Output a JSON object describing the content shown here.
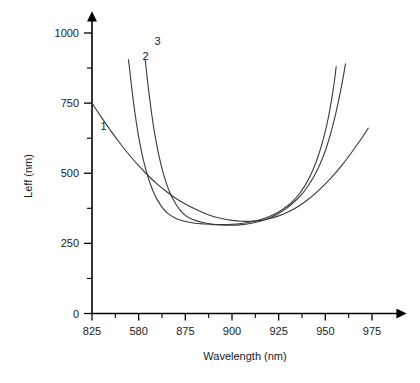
{
  "chart_data": {
    "type": "line",
    "title": "",
    "xlabel": "Wavelength (nm)",
    "ylabel": "Leff (nm)",
    "xlim": [
      825,
      987
    ],
    "ylim": [
      0,
      1060
    ],
    "grid": false,
    "legend_position": "inline-labels",
    "x_ticks_major": [
      {
        "value": 825,
        "label": "825"
      },
      {
        "value": 850,
        "label": "580"
      },
      {
        "value": 875,
        "label": "875"
      },
      {
        "value": 900,
        "label": "900"
      },
      {
        "value": 925,
        "label": "925"
      },
      {
        "value": 950,
        "label": "950"
      },
      {
        "value": 975,
        "label": "975"
      }
    ],
    "x_ticks_minor": [
      837.5,
      862.5,
      887.5,
      912.5,
      937.5,
      962.5
    ],
    "y_ticks_major": [
      {
        "value": 0,
        "label": "0"
      },
      {
        "value": 250,
        "label": "250"
      },
      {
        "value": 500,
        "label": "500"
      },
      {
        "value": 750,
        "label": "750"
      },
      {
        "value": 1000,
        "label": "1000"
      }
    ],
    "y_ticks_minor": [
      125,
      375,
      625,
      875
    ],
    "series": [
      {
        "name": "1",
        "label": "1",
        "label_x": 829.5,
        "label_y": 655,
        "points": [
          [
            825,
            750
          ],
          [
            830,
            700
          ],
          [
            835,
            652
          ],
          [
            840,
            607
          ],
          [
            845,
            565
          ],
          [
            850,
            527
          ],
          [
            855,
            492
          ],
          [
            860,
            461
          ],
          [
            865,
            434
          ],
          [
            870,
            410
          ],
          [
            875,
            390
          ],
          [
            880,
            373
          ],
          [
            885,
            358
          ],
          [
            890,
            346
          ],
          [
            895,
            338
          ],
          [
            900,
            332
          ],
          [
            905,
            329
          ],
          [
            910,
            329
          ],
          [
            915,
            332
          ],
          [
            920,
            338
          ],
          [
            925,
            348
          ],
          [
            930,
            362
          ],
          [
            935,
            380
          ],
          [
            940,
            403
          ],
          [
            945,
            430
          ],
          [
            950,
            462
          ],
          [
            955,
            498
          ],
          [
            960,
            538
          ],
          [
            965,
            583
          ],
          [
            970,
            630
          ],
          [
            973,
            661
          ]
        ]
      },
      {
        "name": "2",
        "label": "2",
        "label_x": 852,
        "label_y": 905,
        "points": [
          [
            844.5,
            905
          ],
          [
            845,
            880
          ],
          [
            846,
            820
          ],
          [
            847,
            765
          ],
          [
            848,
            715
          ],
          [
            849,
            670
          ],
          [
            850,
            630
          ],
          [
            852,
            563
          ],
          [
            854,
            509
          ],
          [
            856,
            466
          ],
          [
            858,
            432
          ],
          [
            860,
            405
          ],
          [
            863,
            375
          ],
          [
            866,
            355
          ],
          [
            870,
            339
          ],
          [
            875,
            328
          ],
          [
            880,
            322
          ],
          [
            885,
            319
          ],
          [
            890,
            317
          ],
          [
            895,
            317
          ],
          [
            900,
            318
          ],
          [
            905,
            321
          ],
          [
            910,
            326
          ],
          [
            915,
            334
          ],
          [
            920,
            346
          ],
          [
            925,
            362
          ],
          [
            930,
            385
          ],
          [
            933,
            403
          ],
          [
            936,
            426
          ],
          [
            939,
            455
          ],
          [
            942,
            492
          ],
          [
            944,
            522
          ],
          [
            946,
            558
          ],
          [
            948,
            600
          ],
          [
            950,
            650
          ],
          [
            951.5,
            695
          ],
          [
            953,
            748
          ],
          [
            954,
            790
          ],
          [
            955,
            835
          ],
          [
            955.8,
            880
          ]
        ]
      },
      {
        "name": "3",
        "label": "3",
        "label_x": 858.5,
        "label_y": 957,
        "points": [
          [
            853.5,
            905
          ],
          [
            854,
            875
          ],
          [
            855,
            815
          ],
          [
            856,
            760
          ],
          [
            857,
            710
          ],
          [
            858,
            665
          ],
          [
            859,
            625
          ],
          [
            861,
            558
          ],
          [
            863,
            504
          ],
          [
            865,
            461
          ],
          [
            867,
            427
          ],
          [
            869,
            400
          ],
          [
            872,
            370
          ],
          [
            875,
            350
          ],
          [
            879,
            335
          ],
          [
            884,
            325
          ],
          [
            889,
            319
          ],
          [
            894,
            316
          ],
          [
            899,
            315
          ],
          [
            904,
            316
          ],
          [
            909,
            320
          ],
          [
            914,
            327
          ],
          [
            919,
            338
          ],
          [
            924,
            353
          ],
          [
            929,
            374
          ],
          [
            934,
            402
          ],
          [
            938,
            430
          ],
          [
            941,
            457
          ],
          [
            944,
            490
          ],
          [
            947,
            530
          ],
          [
            950,
            580
          ],
          [
            952,
            622
          ],
          [
            954,
            670
          ],
          [
            956,
            725
          ],
          [
            958,
            788
          ],
          [
            959.5,
            840
          ],
          [
            960.8,
            890
          ]
        ]
      }
    ]
  }
}
